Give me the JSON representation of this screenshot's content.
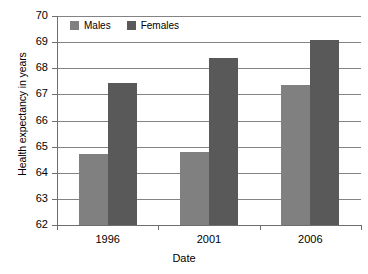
{
  "chart_data": {
    "type": "bar",
    "title": "",
    "xlabel": "Date",
    "ylabel": "Health expectancy in years",
    "categories": [
      "1996",
      "2001",
      "2006"
    ],
    "series": [
      {
        "name": "Males",
        "color": "#808080",
        "values": [
          64.7,
          64.8,
          67.35
        ]
      },
      {
        "name": "Females",
        "color": "#595959",
        "values": [
          67.45,
          68.4,
          69.1
        ]
      }
    ],
    "ylim": [
      62,
      70
    ],
    "ytick_labels": [
      "70",
      "69",
      "68",
      "67",
      "66",
      "65",
      "64",
      "63",
      "62"
    ],
    "ytick_values": [
      70,
      69,
      68,
      67,
      66,
      65,
      64,
      63,
      62
    ],
    "grid": true,
    "legend_position": "top-left"
  },
  "legend": {
    "items": [
      {
        "label": "Males",
        "swatch": "males-swatch-icon"
      },
      {
        "label": "Females",
        "swatch": "females-swatch-icon"
      }
    ]
  }
}
